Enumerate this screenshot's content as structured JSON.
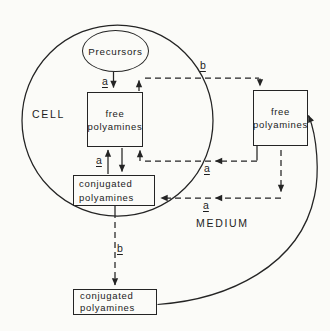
{
  "diagram": {
    "title_hint": "polyamine transport between cell and medium",
    "colors": {
      "ink": "#242424",
      "background": "#fbfbf8"
    },
    "compartments": {
      "cell": "CELL",
      "medium": "MEDIUM"
    },
    "nodes": {
      "precursors": {
        "label": "Precursors"
      },
      "cell_free": {
        "line1": "free",
        "line2": "polyamines"
      },
      "cell_conjugated": {
        "line1": "conjugated",
        "line2": "polyamines"
      },
      "medium_free": {
        "line1": "free",
        "line2": "polyamines"
      },
      "medium_conjugated": {
        "line1": "conjugated",
        "line2": "polyamines"
      }
    },
    "edge_labels": {
      "a_precursors_to_free": "a",
      "a_free_conjugated_exchange": "a",
      "a_medium_free_to_cell_free": "a",
      "a_medium_free_to_cell_conjugated": "a",
      "b_cell_free_to_medium_free": "b",
      "b_cell_conjugated_to_medium_conjugated": "b"
    }
  }
}
